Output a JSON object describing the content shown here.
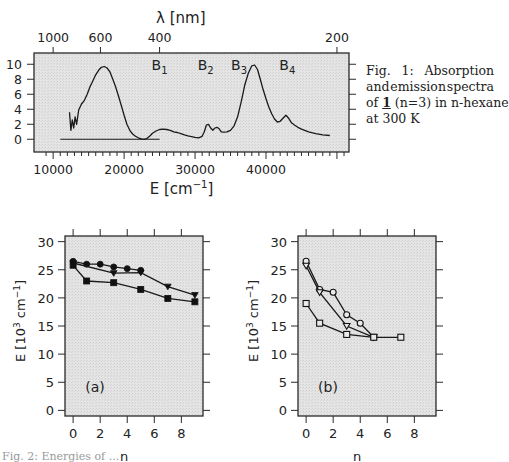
{
  "chart_data": [
    {
      "id": "fig1",
      "type": "line",
      "title": "",
      "xlabel": "E [cm⁻¹]",
      "ylabel": "",
      "top_xlabel": "λ [nm]",
      "xlim": [
        7300,
        51700
      ],
      "ylim": [
        -1.7,
        11.5
      ],
      "grid": false,
      "xticks": [
        10000,
        20000,
        30000,
        40000
      ],
      "xtick_labels": [
        "10000",
        "20000",
        "30000",
        "40000"
      ],
      "top_xticks_nm": [
        1000,
        600,
        400,
        200
      ],
      "top_xtick_labels": [
        "1000",
        "600",
        "400",
        "200"
      ],
      "yticks": [
        0,
        2,
        4,
        6,
        8,
        10
      ],
      "ytick_labels": [
        "0",
        "2",
        "4",
        "6",
        "8",
        "10"
      ],
      "band_labels": [
        {
          "text": "B",
          "sub": "1",
          "x": 25000,
          "y": 9.3
        },
        {
          "text": "B",
          "sub": "2",
          "x": 31500,
          "y": 9.3
        },
        {
          "text": "B",
          "sub": "3",
          "x": 36200,
          "y": 9.3
        },
        {
          "text": "B",
          "sub": "4",
          "x": 43000,
          "y": 9.3
        }
      ],
      "series": [
        {
          "name": "absorption",
          "x": [
            12300,
            12500,
            12700,
            12900,
            13100,
            13300,
            13600,
            14000,
            14400,
            14800,
            15200,
            15600,
            16000,
            16400,
            16800,
            17200,
            17600,
            18000,
            18400,
            18800,
            19200,
            19600,
            20000,
            20400,
            20800,
            21200,
            21600,
            22000,
            22400,
            22800,
            23200,
            23600,
            24000,
            24500,
            25000,
            25500,
            26000,
            26500,
            27000,
            27500,
            28000,
            28500,
            29000,
            29500,
            30000,
            30500,
            31000,
            31300,
            31600,
            31900,
            32200,
            32500,
            32800,
            33100,
            33400,
            33700,
            34000,
            34500,
            35000,
            35500,
            36000,
            36500,
            37000,
            37500,
            38000,
            38400,
            38800,
            39200,
            39600,
            40000,
            40400,
            40800,
            41200,
            41600,
            42000,
            42400,
            42800,
            43200,
            43600,
            44000,
            44500,
            45000,
            46000,
            47000,
            48000,
            49000
          ],
          "y": [
            3.6,
            1.2,
            2.6,
            1.5,
            3.0,
            2.0,
            3.9,
            4.7,
            5.2,
            6.0,
            7.0,
            7.8,
            8.6,
            9.2,
            9.6,
            9.7,
            9.5,
            9.0,
            8.0,
            7.0,
            5.8,
            4.5,
            3.2,
            2.0,
            1.2,
            0.7,
            0.4,
            0.2,
            0.05,
            0.0,
            0.1,
            0.4,
            0.8,
            1.1,
            1.3,
            1.35,
            1.3,
            1.2,
            1.0,
            0.9,
            0.75,
            0.6,
            0.45,
            0.35,
            0.25,
            0.2,
            0.4,
            1.0,
            1.9,
            2.0,
            1.5,
            1.2,
            1.5,
            1.6,
            1.4,
            1.0,
            0.95,
            1.0,
            1.2,
            1.8,
            3.0,
            5.0,
            7.2,
            8.8,
            9.8,
            9.9,
            9.3,
            8.0,
            6.6,
            5.4,
            4.3,
            3.4,
            2.7,
            2.3,
            2.4,
            2.8,
            3.2,
            2.8,
            2.2,
            1.9,
            1.6,
            1.35,
            1.0,
            0.75,
            0.6,
            0.5
          ]
        },
        {
          "name": "emission baseline",
          "x": [
            11000,
            25000
          ],
          "y": [
            0,
            0
          ]
        }
      ]
    },
    {
      "id": "fig2a",
      "type": "line",
      "panel_label": "(a)",
      "xlabel": "n",
      "ylabel": "E [10³ cm⁻¹]",
      "xlim": [
        -0.6,
        9.6
      ],
      "ylim": [
        -1,
        31
      ],
      "xticks": [
        0,
        2,
        4,
        6,
        8
      ],
      "yticks": [
        0,
        5,
        10,
        15,
        20,
        25,
        30
      ],
      "grid": false,
      "series": [
        {
          "name": "filled circles",
          "marker": "circle-filled",
          "x": [
            0,
            1,
            2,
            3,
            4,
            5
          ],
          "y": [
            26.5,
            26.0,
            26.0,
            25.5,
            25.2,
            24.9
          ]
        },
        {
          "name": "filled triangles",
          "marker": "triangle-down-filled",
          "x": [
            0,
            3,
            5,
            7,
            9
          ],
          "y": [
            26.2,
            24.4,
            24.5,
            22.0,
            20.5
          ]
        },
        {
          "name": "filled squares",
          "marker": "square-filled",
          "x": [
            0,
            1,
            3,
            5,
            7,
            9
          ],
          "y": [
            25.8,
            23.0,
            22.7,
            21.5,
            19.9,
            19.3
          ]
        }
      ]
    },
    {
      "id": "fig2b",
      "type": "line",
      "panel_label": "(b)",
      "xlabel": "n",
      "ylabel": "E [10³ cm⁻¹]",
      "xlim": [
        -0.6,
        9.6
      ],
      "ylim": [
        -1,
        31
      ],
      "xticks": [
        0,
        2,
        4,
        6,
        8
      ],
      "yticks": [
        0,
        5,
        10,
        15,
        20,
        25,
        30
      ],
      "grid": false,
      "series": [
        {
          "name": "open circles",
          "marker": "circle-open",
          "x": [
            0,
            1,
            2,
            3,
            4,
            5
          ],
          "y": [
            26.5,
            21.5,
            21.0,
            17.0,
            15.5,
            13.0
          ]
        },
        {
          "name": "open triangles",
          "marker": "triangle-down-open",
          "x": [
            0,
            1,
            3,
            5
          ],
          "y": [
            25.7,
            21.0,
            15.0,
            13.0
          ]
        },
        {
          "name": "open squares",
          "marker": "square-open",
          "x": [
            0,
            1,
            3,
            5,
            7
          ],
          "y": [
            19.0,
            15.5,
            13.5,
            13.0,
            13.0
          ]
        }
      ]
    }
  ],
  "captions": {
    "fig1": {
      "line1_a": "Fig.",
      "line1_b": "1:",
      "line1_c": "Absorption",
      "line2_a": "and",
      "line2_b": "emission",
      "line2_c": "spectra",
      "line3_pre": "of ",
      "line3_compound": "1",
      "line3_post": " (n=3) in n-hexane",
      "line4": "at 300 K"
    },
    "fig2_partial": "Fig. 2: Energies of ..."
  }
}
